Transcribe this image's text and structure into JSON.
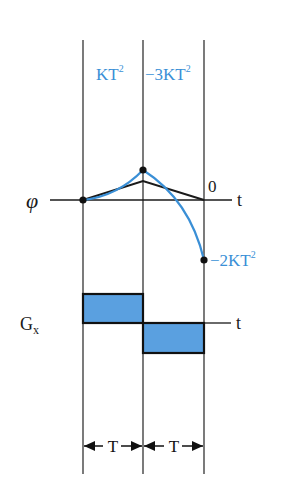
{
  "diagram": {
    "type": "pulse-sequence-phase-diagram",
    "colors": {
      "accent_blue": "#3a8fd6",
      "fill_blue": "#5aa0e0",
      "line_black": "#1a1a1a"
    },
    "top_labels": {
      "first_interval": "KT",
      "first_interval_sup": "2",
      "second_interval": "−3KT",
      "second_interval_sup": "2"
    },
    "phase_axis": {
      "label": "φ",
      "t_label": "t",
      "zero_label": "0",
      "end_value": "−2KT",
      "end_value_sup": "2"
    },
    "gradient_axis": {
      "label": "G",
      "label_sub": "x",
      "t_label": "t"
    },
    "interval_markers": [
      {
        "label": "T"
      },
      {
        "label": "T"
      }
    ]
  }
}
